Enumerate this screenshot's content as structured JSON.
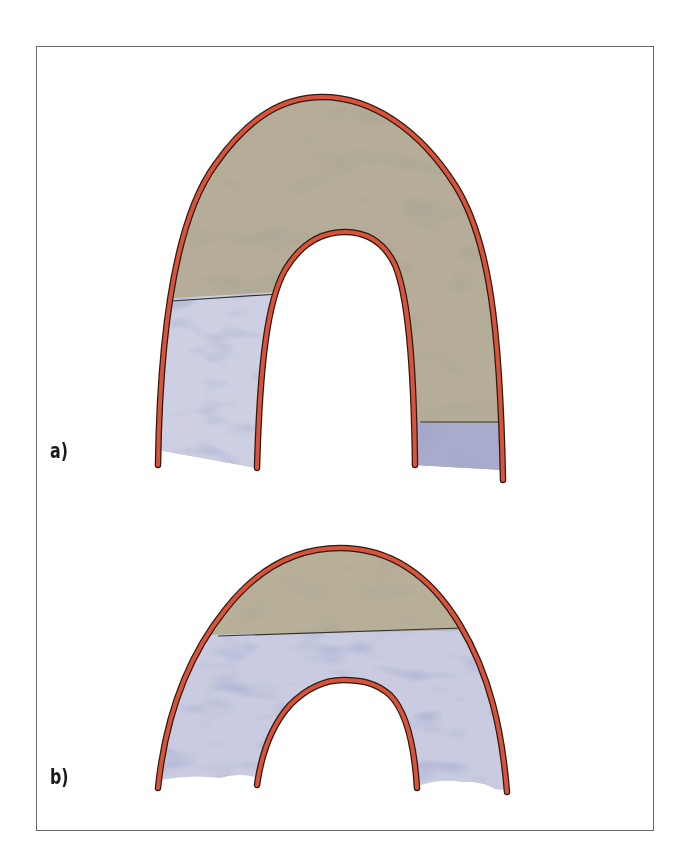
{
  "figure": {
    "panels": [
      {
        "id": "a",
        "label": "a)",
        "description": "Tall arch: upper region brown, lower left leg blue (boundary high), lower right leg blue (boundary low)",
        "regions": [
          {
            "name": "upper-fill",
            "color": "#b5ad98"
          },
          {
            "name": "lower-left-fill",
            "color": "#c9ccdf"
          },
          {
            "name": "lower-right-fill",
            "color": "#9ea1c4"
          }
        ]
      },
      {
        "id": "b",
        "label": "b)",
        "description": "Short arch: small brown cap at crest, rest blue",
        "regions": [
          {
            "name": "cap-fill",
            "color": "#b7af98"
          },
          {
            "name": "body-fill",
            "color": "#c7cadf"
          }
        ]
      }
    ],
    "colors": {
      "outline": "#d9533a",
      "outline_edge": "#2a1a14",
      "boundary_line": "#333333",
      "frame": "#6a6a6a"
    }
  }
}
